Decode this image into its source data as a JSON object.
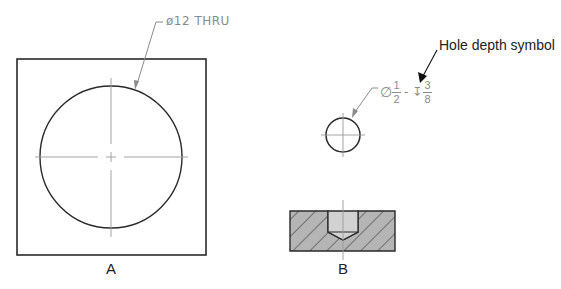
{
  "views": {
    "a": {
      "label": "A",
      "callout": "ø12  THRU"
    },
    "b": {
      "label": "B",
      "callout": {
        "diameter_symbol": "∅",
        "diameter_num": "1",
        "diameter_den": "2",
        "separator": "-",
        "depth_symbol": "↧",
        "depth_num": "3",
        "depth_den": "8"
      }
    }
  },
  "annotation": {
    "text": "Hole depth symbol"
  },
  "colors": {
    "outline": "#222222",
    "centerline": "#9a9a9a",
    "dim_text": "#8a8a8a",
    "section_fill": "#b5b5b5",
    "hole_fill": "#d2d2d2"
  }
}
